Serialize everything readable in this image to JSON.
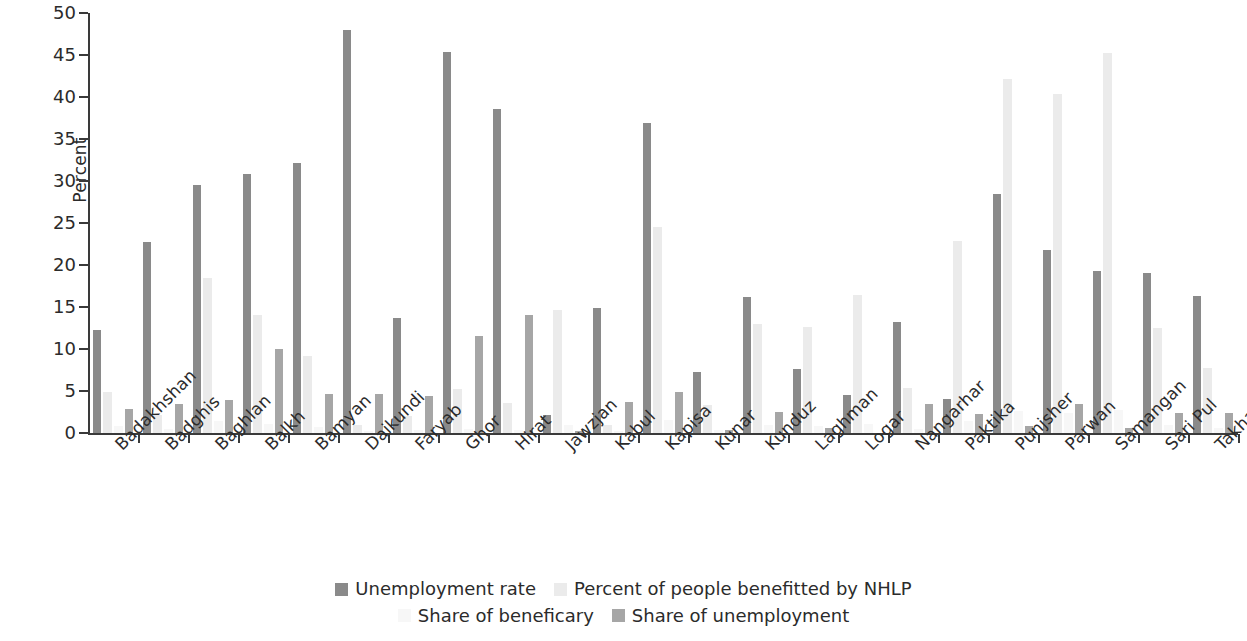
{
  "chart_data": {
    "type": "bar",
    "title": "",
    "subtitle": "",
    "xlabel": "",
    "ylabel": "Percent",
    "ylim": [
      0,
      50
    ],
    "yticks": [
      0,
      5,
      10,
      15,
      20,
      25,
      30,
      35,
      40,
      45,
      50
    ],
    "grid": false,
    "legend_position": "bottom",
    "categories": [
      "Badakhshan",
      "Badghis",
      "Baghlan",
      "Balkh",
      "Bamyan",
      "Daikundi",
      "Faryab",
      "Ghor",
      "Hirat",
      "Jawzjan",
      "Kabul",
      "Kapisa",
      "Kunar",
      "Kunduz",
      "Laghman",
      "Logar",
      "Nangarhar",
      "Paktika",
      "Punjsher",
      "Parwan",
      "Samangan",
      "Sari Pul",
      "Takhar"
    ],
    "series": [
      {
        "name": "Unemployment rate",
        "color": "#8a8a8a",
        "values": [
          12.3,
          22.7,
          29.5,
          30.8,
          32.1,
          48.0,
          13.7,
          45.3,
          38.6,
          2.2,
          14.9,
          36.9,
          7.3,
          16.2,
          7.6,
          4.5,
          13.2,
          4.0,
          28.4,
          21.8,
          19.3,
          19.1,
          16.3
        ]
      },
      {
        "name": "Percent of people benefitted by NHLP",
        "color": "#ebebeb",
        "values": [
          4.9,
          2.1,
          18.5,
          14.0,
          9.2,
          0.9,
          2.0,
          5.2,
          3.6,
          14.7,
          1.0,
          24.5,
          3.3,
          13.0,
          12.6,
          16.4,
          5.3,
          22.8,
          42.2,
          40.3,
          45.2,
          12.5,
          7.7
        ]
      },
      {
        "name": "Share of beneficary",
        "color": "#f7f7f7",
        "values": [
          0.8,
          0.5,
          1.4,
          1.1,
          0.7,
          0.2,
          0.3,
          0.5,
          0.4,
          0.9,
          0.2,
          1.5,
          0.3,
          1.0,
          0.8,
          1.1,
          0.5,
          1.4,
          2.6,
          2.4,
          2.7,
          0.9,
          0.6
        ]
      },
      {
        "name": "Share of unemployment",
        "color": "#a6a6a6",
        "values": [
          2.9,
          3.4,
          3.9,
          10.0,
          4.6,
          4.7,
          4.4,
          11.6,
          14.0,
          0.2,
          3.7,
          4.9,
          0.4,
          2.5,
          0.6,
          0.0,
          3.5,
          2.3,
          0.8,
          3.5,
          0.6,
          2.4,
          2.4
        ]
      }
    ]
  },
  "legend": {
    "rows": [
      [
        {
          "label": "Unemployment rate",
          "series_index": 0
        },
        {
          "label": "Percent of people benefitted by NHLP",
          "series_index": 1
        }
      ],
      [
        {
          "label": "Share of beneficary",
          "series_index": 2
        },
        {
          "label": "Share of unemployment",
          "series_index": 3
        }
      ]
    ]
  },
  "axis": {
    "y_title": "Percent"
  }
}
